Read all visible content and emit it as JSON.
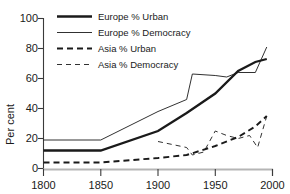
{
  "chart_data": {
    "type": "line",
    "title": "",
    "xlabel": "",
    "ylabel": "Per cent",
    "xlim": [
      1800,
      2000
    ],
    "ylim": [
      0,
      100
    ],
    "xticks": [
      1800,
      1850,
      1900,
      1950,
      2000
    ],
    "yticks": [
      0,
      20,
      40,
      60,
      80,
      100
    ],
    "xtick_labels": [
      "1800",
      "1850",
      "1900",
      "1950",
      "2000"
    ],
    "ytick_labels": [
      "0",
      "20",
      "40",
      "60",
      "80",
      "100"
    ],
    "grid": false,
    "legend_position": "top-left",
    "series": [
      {
        "name": "Europe % Urban",
        "style": "solid-thick",
        "x": [
          1800,
          1850,
          1900,
          1925,
          1950,
          1970,
          1985,
          1995
        ],
        "y": [
          12,
          12,
          25,
          37,
          50,
          65,
          71,
          73
        ]
      },
      {
        "name": "Europe % Democracy",
        "style": "solid-thin",
        "x": [
          1800,
          1850,
          1900,
          1925,
          1930,
          1950,
          1960,
          1970,
          1985,
          1995
        ],
        "y": [
          19,
          19,
          38,
          46,
          63,
          62,
          61,
          64,
          64,
          81
        ]
      },
      {
        "name": "Asia % Urban",
        "style": "dashed-thick",
        "x": [
          1800,
          1850,
          1900,
          1925,
          1950,
          1970,
          1985,
          1995
        ],
        "y": [
          4,
          4,
          7,
          9,
          15,
          21,
          28,
          35
        ]
      },
      {
        "name": "Asia % Democracy",
        "style": "dashed-thin",
        "x": [
          1800,
          1850,
          1900,
          1925,
          1930,
          1940,
          1950,
          1960,
          1970,
          1980,
          1987,
          1995
        ],
        "y": [
          null,
          null,
          18,
          14,
          9,
          11,
          25,
          22,
          20,
          22,
          14,
          35
        ]
      }
    ],
    "asia_democracy_visible_from": 1880
  },
  "legend": {
    "entries": [
      {
        "label": "Europe % Urban",
        "style": "solid-thick"
      },
      {
        "label": "Europe % Democracy",
        "style": "solid-thin"
      },
      {
        "label": "Asia % Urban",
        "style": "dashed-thick"
      },
      {
        "label": "Asia % Democracy",
        "style": "dashed-thin"
      }
    ]
  },
  "axes": {
    "y_title": "Per cent",
    "y_labels": [
      "100",
      "80",
      "60",
      "40",
      "20",
      "0"
    ],
    "x_labels": [
      "1800",
      "1850",
      "1900",
      "1950",
      "2000"
    ]
  }
}
